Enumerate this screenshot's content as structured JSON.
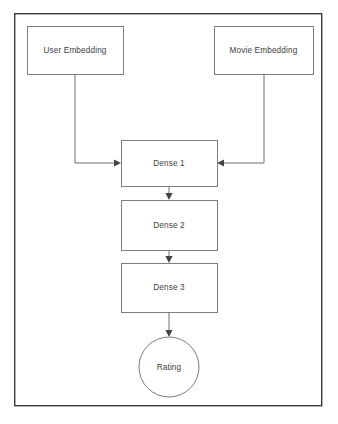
{
  "diagram": {
    "frame": {
      "name": "diagram-frame"
    },
    "nodes": [
      {
        "id": "user-embedding",
        "label": "User Embedding",
        "shape": "rectangle",
        "x": 27,
        "y": 26,
        "width": 96,
        "height": 48
      },
      {
        "id": "movie-embedding",
        "label": "Movie Embedding",
        "shape": "rectangle",
        "x": 214,
        "y": 26,
        "width": 99,
        "height": 48
      },
      {
        "id": "dense-1",
        "label": "Dense 1",
        "shape": "rectangle",
        "x": 121,
        "y": 140,
        "width": 96,
        "height": 46
      },
      {
        "id": "dense-2",
        "label": "Dense 2",
        "shape": "rectangle",
        "x": 121,
        "y": 200,
        "width": 96,
        "height": 50
      },
      {
        "id": "dense-3",
        "label": "Dense 3",
        "shape": "rectangle",
        "x": 121,
        "y": 263,
        "width": 96,
        "height": 49
      },
      {
        "id": "rating",
        "label": "Rating",
        "shape": "circle",
        "cx": 169,
        "cy": 367,
        "r": 30
      }
    ],
    "edges": [
      {
        "id": "edge-user-to-dense1",
        "from": "user-embedding",
        "to": "dense-1",
        "path": "M 75 74 L 75 163 L 114 163",
        "arrow_x": 121,
        "arrow_y": 163,
        "arrow_dir": "right"
      },
      {
        "id": "edge-movie-to-dense1",
        "from": "movie-embedding",
        "to": "dense-1",
        "path": "M 264 74 L 264 163 L 224 163",
        "arrow_x": 217,
        "arrow_y": 163,
        "arrow_dir": "left"
      },
      {
        "id": "edge-dense1-to-dense2",
        "from": "dense-1",
        "to": "dense-2",
        "path": "M 169 186 L 169 193",
        "arrow_x": 169,
        "arrow_y": 200,
        "arrow_dir": "down"
      },
      {
        "id": "edge-dense2-to-dense3",
        "from": "dense-2",
        "to": "dense-3",
        "path": "M 169 250 L 169 256",
        "arrow_x": 169,
        "arrow_y": 263,
        "arrow_dir": "down"
      },
      {
        "id": "edge-dense3-to-rating",
        "from": "dense-3",
        "to": "rating",
        "path": "M 169 312 L 169 330",
        "arrow_x": 169,
        "arrow_y": 337,
        "arrow_dir": "down"
      }
    ],
    "colors": {
      "background": "#ffffff",
      "frame_border": "#3a3a3a",
      "node_border": "#7d7d7d",
      "node_fill": "#ffffff",
      "edge_stroke": "#6f6f6f",
      "arrow_fill": "#444444",
      "label_text": "#3d3d3d"
    }
  }
}
